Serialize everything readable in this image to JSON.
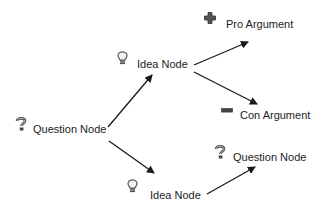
{
  "diagram": {
    "nodes": [
      {
        "id": "q1",
        "type": "question",
        "icon": "question-icon",
        "label": "Question Node"
      },
      {
        "id": "i1",
        "type": "idea",
        "icon": "lightbulb-icon",
        "label": "Idea Node"
      },
      {
        "id": "pro",
        "type": "pro",
        "icon": "plus-icon",
        "label": "Pro Argument"
      },
      {
        "id": "con",
        "type": "con",
        "icon": "minus-icon",
        "label": "Con Argument"
      },
      {
        "id": "i2",
        "type": "idea",
        "icon": "lightbulb-icon",
        "label": "Idea Node"
      },
      {
        "id": "q2",
        "type": "question",
        "icon": "question-icon",
        "label": "Question Node"
      }
    ],
    "edges": [
      {
        "from": "q1",
        "to": "i1"
      },
      {
        "from": "q1",
        "to": "i2"
      },
      {
        "from": "i1",
        "to": "pro"
      },
      {
        "from": "i1",
        "to": "con"
      },
      {
        "from": "i2",
        "to": "q2"
      }
    ],
    "colors": {
      "edge": "#1a1a1a",
      "text": "#222222",
      "icon": "#555555",
      "background": "#ffffff"
    }
  }
}
